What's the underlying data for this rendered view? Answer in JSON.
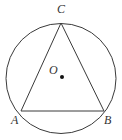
{
  "figure": {
    "type": "geometry",
    "colors": {
      "stroke": "#3a3a3a",
      "background": "#ffffff",
      "label": "#333333"
    },
    "circle": {
      "cx": 61,
      "cy": 78.5,
      "r": 55
    },
    "points": {
      "A": {
        "x": 21,
        "y": 111,
        "label": "A"
      },
      "B": {
        "x": 104,
        "y": 111,
        "label": "B"
      },
      "C": {
        "x": 61,
        "y": 23,
        "label": "C"
      },
      "O": {
        "x": 62,
        "y": 77,
        "label": "O"
      }
    },
    "labels": {
      "A": "A",
      "B": "B",
      "C": "C",
      "O": "O"
    }
  }
}
